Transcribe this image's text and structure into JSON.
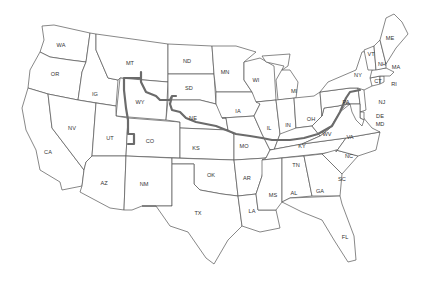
{
  "map": {
    "title": "",
    "colors": {
      "background": "#ffffff",
      "border": "#555555",
      "route": "#6b6b6b",
      "label": "#333333"
    },
    "route": {
      "description": "Route line from Wyoming / Montana border eastward through Nebraska, Missouri, Kentucky, West Virginia, Virginia to Pennsylvania",
      "states_crossed": [
        "WY",
        "SD",
        "NE",
        "MO",
        "IL",
        "KY",
        "WV",
        "VA",
        "PA"
      ]
    },
    "labels": {
      "WA": "WA",
      "OR": "OR",
      "ID": "IG",
      "MT": "MT",
      "ND": "ND",
      "SD": "SD",
      "MN": "MN",
      "WI": "WI",
      "MI": "MI",
      "NY": "NY",
      "VT": "VT",
      "NH": "NH",
      "ME": "ME",
      "MA": "MA",
      "RI": "RI",
      "CT": "CT",
      "NJ": "NJ",
      "PA": "PA",
      "DE": "DE",
      "MD": "MD",
      "WY": "WY",
      "NE": "NE",
      "IA": "IA",
      "IL": "IL",
      "IN": "IN",
      "OH": "OH",
      "WV": "WV",
      "VA": "VA",
      "KY": "KY",
      "NV": "NV",
      "CA": "CA",
      "UT": "UT",
      "CO": "CO",
      "KS": "KS",
      "MO": "MO",
      "TN": "TN",
      "NC": "NC",
      "SC": "SC",
      "AZ": "AZ",
      "NM": "NM",
      "OK": "OK",
      "AR": "AR",
      "MS": "MS",
      "AL": "AL",
      "GA": "GA",
      "LA": "LA",
      "TX": "TX",
      "FL": "FL"
    }
  }
}
